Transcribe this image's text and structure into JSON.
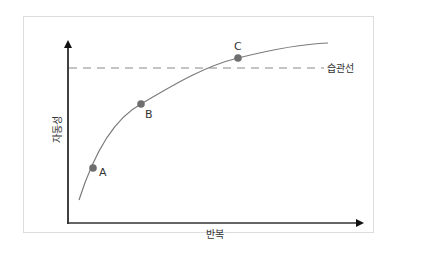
{
  "diagram": {
    "title": "",
    "x_axis_label": "반복",
    "y_axis_label": "자동성",
    "threshold_label": "습관선",
    "points": [
      {
        "label": "A"
      },
      {
        "label": "B"
      },
      {
        "label": "C"
      }
    ],
    "colors": {
      "curve": "#7a7a7a",
      "point": "#6e6e6e",
      "axis": "#111111",
      "dashed_line": "#888888",
      "frame_border": "#dcdcdc"
    }
  }
}
